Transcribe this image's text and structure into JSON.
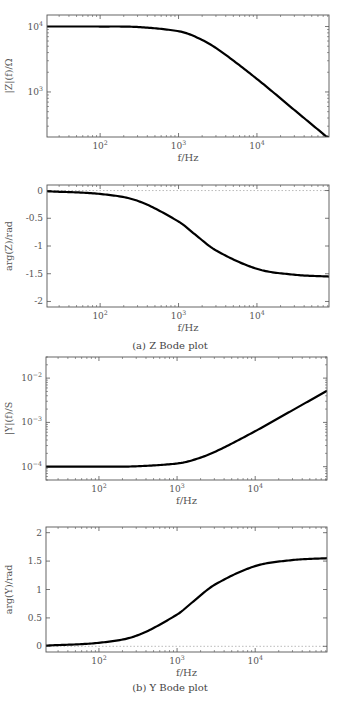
{
  "figure": {
    "captions": {
      "a": "(a)  Z Bode plot",
      "b": "(b)  Y Bode plot"
    },
    "colors": {
      "curve": "#000000",
      "axis": "#555555",
      "text": "#555555",
      "zero_line": "#aaaaaa"
    }
  },
  "chart_data": [
    {
      "id": "z_mag",
      "type": "line",
      "title": "",
      "xlabel": "f/Hz",
      "ylabel": "|Z|(f)/Ω",
      "xscale": "log",
      "yscale": "log",
      "xlim": [
        21,
        83000
      ],
      "ylim": [
        205,
        15000
      ],
      "xticks": [
        {
          "v": 100,
          "label": "10^2"
        },
        {
          "v": 1000,
          "label": "10^3"
        },
        {
          "v": 10000,
          "label": "10^4"
        }
      ],
      "yticks": [
        {
          "v": 1000,
          "label": "10^3"
        },
        {
          "v": 10000,
          "label": "10^4"
        }
      ],
      "grid": false,
      "series": [
        {
          "name": "|Z|",
          "x": [
            21,
            100,
            300,
            1000,
            1600,
            3000,
            10000,
            30000,
            83000
          ],
          "values": [
            10000,
            9998,
            9830,
            8480,
            7070,
            4700,
            1580,
            530,
            193
          ]
        }
      ],
      "frame": {
        "left": 47,
        "top": 15,
        "right": 329,
        "bottom": 137
      }
    },
    {
      "id": "z_phase",
      "type": "line",
      "title": "",
      "xlabel": "f/Hz",
      "ylabel": "arg(Z)/rad",
      "xscale": "log",
      "yscale": "linear",
      "xlim": [
        21,
        83000
      ],
      "ylim": [
        -2.1,
        0.1
      ],
      "xticks": [
        {
          "v": 100,
          "label": "10^2"
        },
        {
          "v": 1000,
          "label": "10^3"
        },
        {
          "v": 10000,
          "label": "10^4"
        }
      ],
      "yticks": [
        {
          "v": 0,
          "label": "0"
        },
        {
          "v": -0.5,
          "label": "-0.5"
        },
        {
          "v": -1,
          "label": "-1"
        },
        {
          "v": -1.5,
          "label": "-1.5"
        },
        {
          "v": -2,
          "label": "-2"
        }
      ],
      "zero_line": true,
      "grid": false,
      "series": [
        {
          "name": "arg(Z)",
          "x": [
            21,
            100,
            300,
            1000,
            1600,
            3000,
            10000,
            30000,
            83000
          ],
          "values": [
            -0.013,
            -0.062,
            -0.185,
            -0.559,
            -0.785,
            -1.08,
            -1.412,
            -1.518,
            -1.551
          ]
        }
      ],
      "frame": {
        "left": 47,
        "top": 185,
        "right": 329,
        "bottom": 307
      }
    },
    {
      "id": "y_mag",
      "type": "line",
      "title": "",
      "xlabel": "f/Hz",
      "ylabel": "|Y|(f)/S",
      "xscale": "log",
      "yscale": "log",
      "xlim": [
        21,
        83000
      ],
      "ylim": [
        5e-05,
        0.03
      ],
      "xticks": [
        {
          "v": 100,
          "label": "10^2"
        },
        {
          "v": 1000,
          "label": "10^3"
        },
        {
          "v": 10000,
          "label": "10^4"
        }
      ],
      "yticks": [
        {
          "v": 0.0001,
          "label": "10^-4"
        },
        {
          "v": 0.001,
          "label": "10^-3"
        },
        {
          "v": 0.01,
          "label": "10^-2"
        }
      ],
      "grid": false,
      "series": [
        {
          "name": "|Y|",
          "x": [
            21,
            100,
            300,
            1000,
            1600,
            3000,
            10000,
            30000,
            83000
          ],
          "values": [
            0.0001,
            0.0001,
            0.000102,
            0.000118,
            0.000141,
            0.000213,
            0.000633,
            0.00188,
            0.00519
          ]
        }
      ],
      "frame": {
        "left": 46,
        "top": 357,
        "right": 327,
        "bottom": 480
      }
    },
    {
      "id": "y_phase",
      "type": "line",
      "title": "",
      "xlabel": "f/Hz",
      "ylabel": "arg(Y)/rad",
      "xscale": "log",
      "yscale": "linear",
      "xlim": [
        21,
        83000
      ],
      "ylim": [
        -0.1,
        2.1
      ],
      "xticks": [
        {
          "v": 100,
          "label": "10^2"
        },
        {
          "v": 1000,
          "label": "10^3"
        },
        {
          "v": 10000,
          "label": "10^4"
        }
      ],
      "yticks": [
        {
          "v": 0,
          "label": "0"
        },
        {
          "v": 0.5,
          "label": "0.5"
        },
        {
          "v": 1,
          "label": "1"
        },
        {
          "v": 1.5,
          "label": "1.5"
        },
        {
          "v": 2,
          "label": "2"
        }
      ],
      "zero_line": true,
      "grid": false,
      "series": [
        {
          "name": "arg(Y)",
          "x": [
            21,
            100,
            300,
            1000,
            1600,
            3000,
            10000,
            30000,
            83000
          ],
          "values": [
            0.013,
            0.062,
            0.185,
            0.559,
            0.785,
            1.08,
            1.412,
            1.518,
            1.551
          ]
        }
      ],
      "frame": {
        "left": 46,
        "top": 527,
        "right": 327,
        "bottom": 652
      }
    }
  ]
}
